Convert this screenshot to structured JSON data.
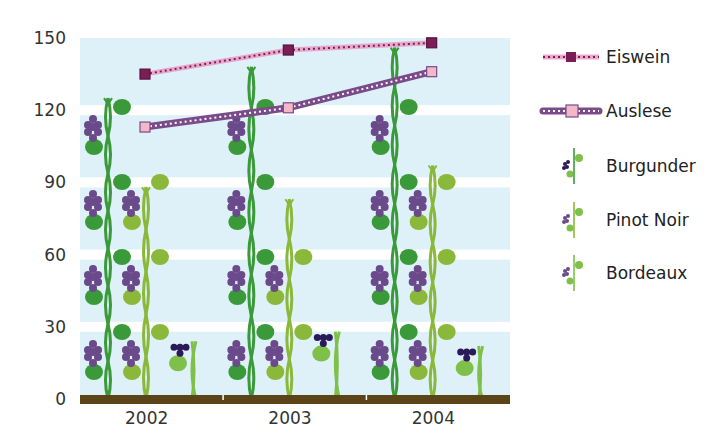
{
  "chart_data": {
    "type": "bar",
    "title": "",
    "xlabel": "",
    "ylabel": "",
    "ylim": [
      0,
      150
    ],
    "yticks": [
      0,
      30,
      60,
      90,
      120,
      150
    ],
    "categories": [
      "2002",
      "2003",
      "2004"
    ],
    "grid": true,
    "legend_position": "right",
    "series": [
      {
        "name": "Burgunder",
        "type": "bar",
        "values": [
          125,
          138,
          146
        ],
        "color": "#3a9a3a"
      },
      {
        "name": "Pinot Noir",
        "type": "bar",
        "values": [
          88,
          83,
          97
        ],
        "color": "#8ab83a"
      },
      {
        "name": "Bordeaux",
        "type": "bar",
        "values": [
          24,
          28,
          22
        ],
        "color": "#7ec04a"
      },
      {
        "name": "Eiswein",
        "type": "line",
        "values": [
          135,
          145,
          148
        ],
        "color": "#7a1f55",
        "line_color": "#e8a8cc"
      },
      {
        "name": "Auslese",
        "type": "line",
        "values": [
          113,
          121,
          136
        ],
        "color": "#f2b8c8",
        "line_color": "#7a4a8a"
      }
    ]
  },
  "legend": [
    {
      "label": "Eiswein",
      "icon": "line-dark-square-marker-icon"
    },
    {
      "label": "Auslese",
      "icon": "line-light-square-marker-icon"
    },
    {
      "label": "Burgunder",
      "icon": "grapevine-icon"
    },
    {
      "label": "Pinot Noir",
      "icon": "grapevine-icon"
    },
    {
      "label": "Bordeaux",
      "icon": "grapevine-icon"
    }
  ],
  "colors": {
    "plot_bg": "#dff1f8",
    "band": "#ffffff",
    "ground": "#5a4418",
    "grape": "#6a4a8a",
    "grape_dark": "#2a1a5a"
  }
}
